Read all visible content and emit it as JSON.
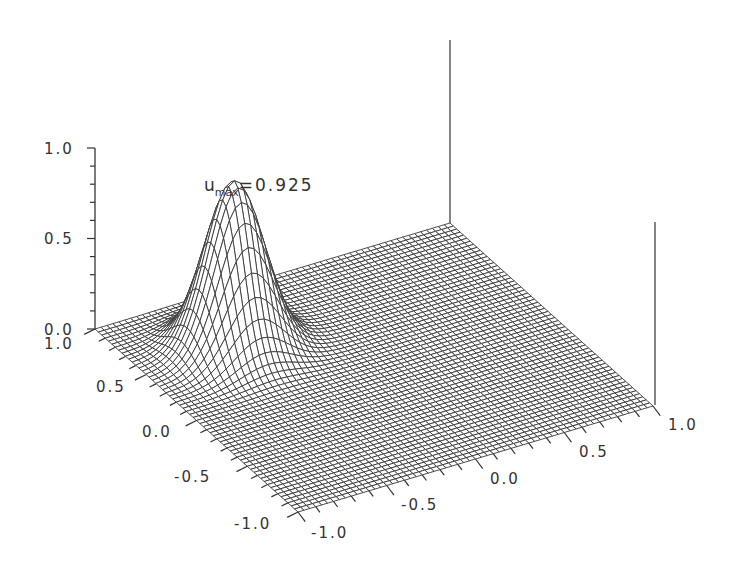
{
  "chart_data": {
    "type": "surface",
    "title": "",
    "annotation": {
      "base": "u",
      "subscript": "max",
      "value_text": "=0.925",
      "value": 0.925
    },
    "z_axis": {
      "range": [
        0.0,
        1.0
      ],
      "ticks": [
        "0.0",
        "0.5",
        "1.0"
      ],
      "minor_ticks_per_major": 5
    },
    "x_axis": {
      "range": [
        -1.0,
        1.0
      ],
      "ticks": [
        "-1.0",
        "-0.5",
        "0.0",
        "0.5",
        "1.0"
      ]
    },
    "y_axis": {
      "range": [
        -1.0,
        1.0
      ],
      "ticks": [
        "-1.0",
        "-0.5",
        "0.0",
        "0.5",
        "1.0"
      ]
    },
    "surface": {
      "function": "gaussian_bump",
      "peak_value": 0.925,
      "peak_location_xy": [
        -0.5,
        0.5
      ],
      "width_sigma": 0.15,
      "grid": 60,
      "base_value": 0.0
    },
    "colors": {
      "mesh": "#3a3a3a",
      "axis": "#333333",
      "background": "#ffffff"
    },
    "grid": false,
    "legend": "none"
  }
}
